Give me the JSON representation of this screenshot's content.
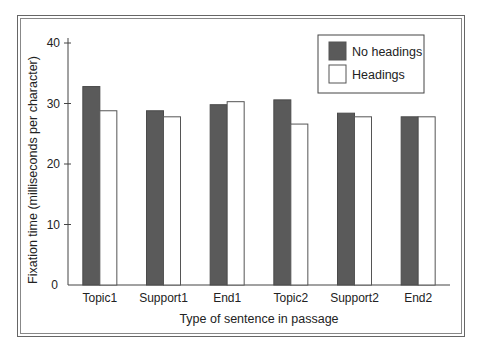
{
  "chart_data": {
    "type": "bar",
    "title": "",
    "xlabel": "Type of sentence in passage",
    "ylabel": "Fixation time (milliseconds per character)",
    "ylim": [
      0,
      40
    ],
    "yticks": [
      0,
      10,
      20,
      30,
      40
    ],
    "grid": false,
    "legend_position": "top-right",
    "categories": [
      "Topic1",
      "Support1",
      "End1",
      "Topic2",
      "Support2",
      "End2"
    ],
    "series": [
      {
        "name": "No headings",
        "color": "#5a5a5a",
        "values": [
          32.8,
          28.8,
          29.8,
          30.6,
          28.4,
          27.8
        ]
      },
      {
        "name": "Headings",
        "color": "#ffffff",
        "values": [
          28.8,
          27.8,
          30.3,
          26.6,
          27.8,
          27.8
        ]
      }
    ]
  },
  "legend": {
    "items": [
      {
        "label": "No headings"
      },
      {
        "label": "Headings"
      }
    ]
  },
  "axis": {
    "x_title": "Type of sentence in passage",
    "y_title": "Fixation time (milliseconds per character)",
    "y_tick_labels": [
      "0",
      "10",
      "20",
      "30",
      "40"
    ]
  }
}
